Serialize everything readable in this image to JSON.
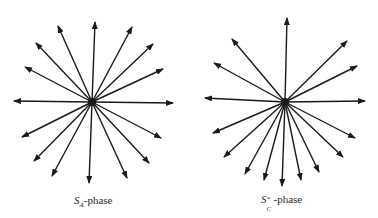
{
  "figure": {
    "stroke_color": "#1a1a1a",
    "panels": [
      {
        "id": "sa-phase",
        "label": {
          "symbol": "S",
          "subscript": "A",
          "superscript": "",
          "suffix": "-phase"
        },
        "center": [
          92,
          102
        ],
        "arrow_tips": [
          [
            95,
            22
          ],
          [
            58,
            26
          ],
          [
            36,
            43
          ],
          [
            25,
            67
          ],
          [
            14,
            101
          ],
          [
            132,
            27
          ],
          [
            153,
            44
          ],
          [
            163,
            69
          ],
          [
            173,
            103
          ],
          [
            22,
            137
          ],
          [
            34,
            161
          ],
          [
            52,
            176
          ],
          [
            89,
            183
          ],
          [
            127,
            178
          ],
          [
            149,
            163
          ],
          [
            161,
            138
          ]
        ]
      },
      {
        "id": "sc-star-phase",
        "label": {
          "symbol": "S",
          "subscript": "C",
          "superscript": "*",
          "suffix": "-phase"
        },
        "center": [
          285,
          102
        ],
        "arrow_tips": [
          [
            287,
            18
          ],
          [
            232,
            39
          ],
          [
            214,
            63
          ],
          [
            205,
            98
          ],
          [
            347,
            41
          ],
          [
            357,
            66
          ],
          [
            365,
            101
          ],
          [
            213,
            133
          ],
          [
            224,
            157
          ],
          [
            245,
            174
          ],
          [
            264,
            180
          ],
          [
            282,
            186
          ],
          [
            301,
            180
          ],
          [
            319,
            172
          ],
          [
            343,
            157
          ],
          [
            355,
            138
          ]
        ]
      }
    ]
  }
}
